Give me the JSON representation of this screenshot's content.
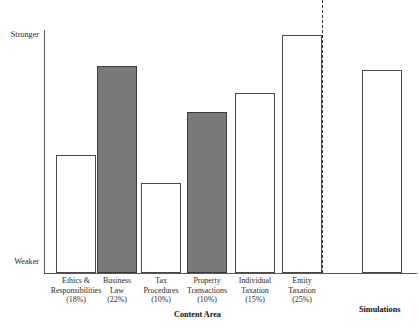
{
  "chart_data": {
    "type": "bar",
    "title": "",
    "subtitle": "",
    "xlabel": "Content Area",
    "ylabel": "",
    "ytick_labels": [
      "Weaker",
      "Stronger"
    ],
    "ylim_labels": {
      "low": "Weaker",
      "high": "Stronger"
    },
    "grid": false,
    "legend": "none",
    "axis_note": "y-axis is ordinal/qualitative: Weaker (bottom) to Stronger (top); no numeric ticks",
    "groups": [
      {
        "name": "Content Area",
        "label": "Content Area"
      },
      {
        "name": "Simulations",
        "label": "Simulations"
      }
    ],
    "categories": [
      "Ethics & Responsibilities (18%)",
      "Business Law (22%)",
      "Tax Procedures (10%)",
      "Property Transactions (10%)",
      "Individual Taxation (15%)",
      "Entity Taxation (25%)",
      "Simulations"
    ],
    "values": [
      48.6,
      85.2,
      37.0,
      66.3,
      74.1,
      97.9,
      83.5
    ],
    "bars": [
      {
        "label_lines": [
          "Ethics &",
          "Responsibilities",
          "(18%)"
        ],
        "category": "Ethics & Responsibilities",
        "weight": "(18%)",
        "group": "Content Area",
        "value": 48.6,
        "fill": "hollow"
      },
      {
        "label_lines": [
          "Business",
          "Law",
          "(22%)"
        ],
        "category": "Business Law",
        "weight": "(22%)",
        "group": "Content Area",
        "value": 85.2,
        "fill": "filled"
      },
      {
        "label_lines": [
          "Tax",
          "Procedures",
          "(10%)"
        ],
        "category": "Tax Procedures",
        "weight": "(10%)",
        "group": "Content Area",
        "value": 37.0,
        "fill": "hollow"
      },
      {
        "label_lines": [
          "Property",
          "Transactions",
          "(10%)"
        ],
        "category": "Property Transactions",
        "weight": "(10%)",
        "group": "Content Area",
        "value": 66.3,
        "fill": "filled"
      },
      {
        "label_lines": [
          "Individual",
          "Taxation",
          "(15%)"
        ],
        "category": "Individual Taxation",
        "weight": "(15%)",
        "group": "Content Area",
        "value": 74.1,
        "fill": "hollow"
      },
      {
        "label_lines": [
          "Entity",
          "Taxation",
          "(25%)"
        ],
        "category": "Entity Taxation",
        "weight": "(25%)",
        "group": "Content Area",
        "value": 97.9,
        "fill": "hollow"
      },
      {
        "label_lines": [],
        "category": "Simulations",
        "weight": "",
        "group": "Simulations",
        "value": 83.5,
        "fill": "hollow"
      }
    ],
    "colors": {
      "hollow_fill": "#ffffff",
      "filled_fill": "#7a7a7a",
      "bar_stroke": "#4a4a4a",
      "axis": "#555555",
      "divider": "#333333",
      "text": "#2a2a2a"
    },
    "divider": {
      "style": "dashed",
      "position_after_category": "Entity Taxation (25%)",
      "note": "dashed vertical rule separating Content Area bars from Simulations bar"
    }
  },
  "top_artifact": {
    "text": ""
  }
}
